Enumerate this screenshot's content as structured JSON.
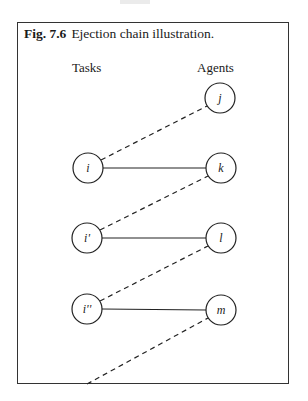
{
  "figure": {
    "number": "Fig. 7.6",
    "caption": "Ejection chain illustration.",
    "column_labels": {
      "left": "Tasks",
      "right": "Agents"
    },
    "nodes": {
      "tasks": [
        {
          "id": "i",
          "label": "i",
          "cx": 88,
          "cy": 168
        },
        {
          "id": "i1",
          "label": "i'",
          "cx": 87,
          "cy": 238
        },
        {
          "id": "i2",
          "label": "i''",
          "cx": 87,
          "cy": 309
        }
      ],
      "agents": [
        {
          "id": "j",
          "label": "j",
          "cx": 220,
          "cy": 98
        },
        {
          "id": "k",
          "label": "k",
          "cx": 221,
          "cy": 168
        },
        {
          "id": "l",
          "label": "l",
          "cx": 221,
          "cy": 238
        },
        {
          "id": "m",
          "label": "m",
          "cx": 221,
          "cy": 310
        }
      ]
    },
    "edges": {
      "solid": [
        [
          "i",
          "k"
        ],
        [
          "i1",
          "l"
        ],
        [
          "i2",
          "m"
        ]
      ],
      "dashed": [
        [
          "i",
          "j"
        ],
        [
          "i1",
          "k"
        ],
        [
          "i2",
          "l"
        ],
        [
          "out",
          "m"
        ]
      ]
    },
    "node_radius": 15
  }
}
